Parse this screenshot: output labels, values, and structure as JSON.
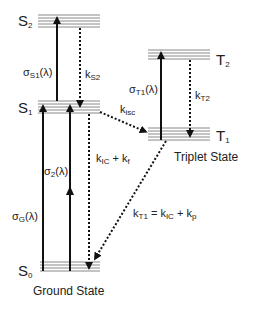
{
  "diagram": {
    "type": "Jablonski energy level diagram",
    "levels": {
      "S2": {
        "label": "S",
        "sub": "2"
      },
      "S1": {
        "label": "S",
        "sub": "1"
      },
      "S0": {
        "label": "S",
        "sub": "0"
      },
      "T2": {
        "label": "T",
        "sub": "2"
      },
      "T1": {
        "label": "T",
        "sub": "1"
      }
    },
    "transitions": {
      "sigma_s1": {
        "main": "σ",
        "sub": "S1",
        "tail": "(λ)"
      },
      "k_s2": {
        "main": "k",
        "sub": "S2"
      },
      "k_isc": {
        "main": "k",
        "sub": "isc"
      },
      "sigma_t1": {
        "main": "σ",
        "sub": "T1",
        "tail": "(λ)"
      },
      "k_t2": {
        "main": "k",
        "sub": "T2"
      },
      "sigma_2": {
        "main": "σ",
        "sub": "2",
        "tail": "(λ)"
      },
      "k_ic_f": {
        "k1": "k",
        "s1": "IC",
        "plus": " + ",
        "k2": "k",
        "s2": "f"
      },
      "sigma_g": {
        "main": "σ",
        "sub": "G",
        "tail": "(λ)"
      },
      "k_t1": {
        "k0": "k",
        "s0": "T1",
        "eq": " = ",
        "k1": "k",
        "s1": "IC",
        "plus": " + ",
        "k2": "k",
        "s2": "p"
      }
    },
    "state_labels": {
      "triplet": "Triplet State",
      "ground": "Ground State"
    },
    "colors": {
      "level_line": "#888888",
      "arrow": "#111111"
    }
  }
}
